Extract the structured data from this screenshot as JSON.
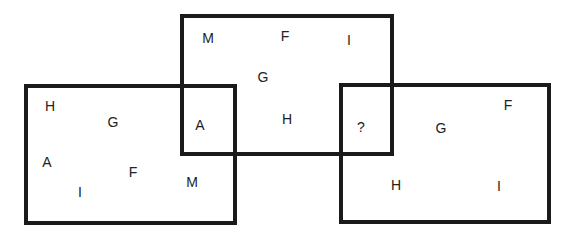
{
  "diagram": {
    "type": "overlapping-rectangles-puzzle",
    "boxes": [
      {
        "id": "left",
        "x": 24,
        "y": 84,
        "w": 213,
        "h": 141
      },
      {
        "id": "middle",
        "x": 180,
        "y": 14,
        "w": 214,
        "h": 142
      },
      {
        "id": "right",
        "x": 339,
        "y": 83,
        "w": 212,
        "h": 141
      }
    ],
    "labels": [
      {
        "text": "M",
        "x": 208,
        "y": 38
      },
      {
        "text": "F",
        "x": 285,
        "y": 36
      },
      {
        "text": "I",
        "x": 349,
        "y": 40
      },
      {
        "text": "G",
        "x": 263,
        "y": 77
      },
      {
        "text": "H",
        "x": 287,
        "y": 119
      },
      {
        "text": "A",
        "x": 200,
        "y": 125
      },
      {
        "text": "?",
        "x": 361,
        "y": 127
      },
      {
        "text": "H",
        "x": 50,
        "y": 106
      },
      {
        "text": "G",
        "x": 113,
        "y": 122
      },
      {
        "text": "A",
        "x": 47,
        "y": 162
      },
      {
        "text": "F",
        "x": 133,
        "y": 172
      },
      {
        "text": "I",
        "x": 80,
        "y": 192
      },
      {
        "text": "M",
        "x": 192,
        "y": 182
      },
      {
        "text": "G",
        "x": 441,
        "y": 128
      },
      {
        "text": "F",
        "x": 508,
        "y": 105
      },
      {
        "text": "H",
        "x": 396,
        "y": 185
      },
      {
        "text": "I",
        "x": 499,
        "y": 186
      }
    ]
  }
}
